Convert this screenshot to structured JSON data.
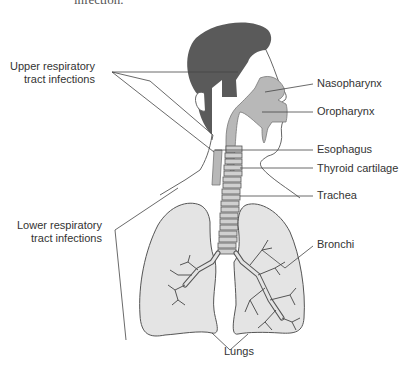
{
  "caption_fragment": "infection.",
  "labels": {
    "upper": [
      "Upper respiratory",
      "tract infections"
    ],
    "lower": [
      "Lower respiratory",
      "tract infections"
    ],
    "nasopharynx": "Nasopharynx",
    "oropharynx": "Oropharynx",
    "esophagus": "Esophagus",
    "thyroid_cartilage": "Thyroid cartilage",
    "trachea": "Trachea",
    "bronchi": "Bronchi",
    "lungs": "Lungs"
  },
  "colors": {
    "hair": "#5a5a5a",
    "airway": "#b8b8b8",
    "lung_fill": "#e4e4e4",
    "outline": "#555555",
    "leader_line": "#444444"
  }
}
